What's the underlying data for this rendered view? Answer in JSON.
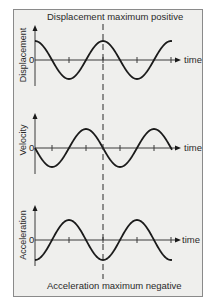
{
  "diagram": {
    "top_caption": "Displacement maximum positive",
    "bottom_caption": "Acceleration maximum negative",
    "time_label": "time",
    "zero_label": "0",
    "panels": [
      {
        "id": "displacement",
        "ylabel": "Displacement",
        "axis_y": 60,
        "amplitude": 19,
        "phase": "cos",
        "sign": 1
      },
      {
        "id": "velocity",
        "ylabel": "Velocity",
        "axis_y": 148,
        "amplitude": 19,
        "phase": "sin",
        "sign": -1
      },
      {
        "id": "acceleration",
        "ylabel": "Acceleration",
        "axis_y": 240,
        "amplitude": 20,
        "phase": "cos",
        "sign": -1
      }
    ],
    "x_start": 35,
    "x_end": 172,
    "period_px": 68,
    "dashed_line_x": 103,
    "colors": {
      "curve": "#1a1a1a",
      "axis": "#3a3a3a",
      "background": "#efefed",
      "border": "#8a8a8a"
    }
  }
}
